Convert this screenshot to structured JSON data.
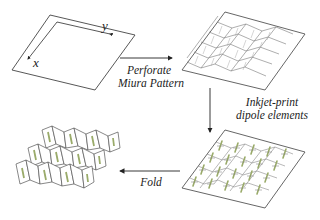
{
  "diagram": {
    "steps": [
      {
        "id": "flat-sheet",
        "axes": {
          "x": "x",
          "y": "y"
        }
      },
      {
        "id": "perforated-sheet"
      },
      {
        "id": "printed-sheet"
      },
      {
        "id": "folded-structure"
      }
    ],
    "arrows": [
      {
        "from": "flat-sheet",
        "to": "perforated-sheet",
        "label_line1": "Perforate",
        "label_line2": "Miura Pattern"
      },
      {
        "from": "perforated-sheet",
        "to": "printed-sheet",
        "label_line1": "Inkjet-print",
        "label_line2": "dipole elements"
      },
      {
        "from": "printed-sheet",
        "to": "folded-structure",
        "label_line1": "Fold"
      }
    ],
    "colors": {
      "line": "#444444",
      "dipole": "#9aab6a",
      "fold_line": "#888888"
    }
  }
}
